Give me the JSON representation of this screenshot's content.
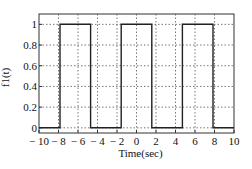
{
  "chart_data": {
    "type": "line",
    "title": "",
    "xlabel": "Time(sec)",
    "ylabel": "f1(t)",
    "xlim": [
      -10,
      10
    ],
    "ylim": [
      -0.05,
      1.1
    ],
    "grid": true,
    "legend": null,
    "x_ticks": [
      -10,
      -8,
      -6,
      -4,
      -2,
      0,
      2,
      4,
      6,
      8,
      10
    ],
    "x_tick_labels": [
      "− 10",
      "− 8",
      "− 6",
      "− 4",
      "− 2",
      "0",
      "2",
      "4",
      "6",
      "8",
      "10"
    ],
    "y_ticks": [
      0,
      0.2,
      0.4,
      0.6,
      0.8,
      1
    ],
    "y_tick_labels": [
      "0",
      "0.2",
      "0.4",
      "0.6",
      "0.8",
      "1"
    ],
    "series": [
      {
        "name": "f1(t)",
        "description": "Rectangular pulse train, amplitude 1, width π, period 2π, truncated to [-8, 8]",
        "x": [
          -10,
          -7.85,
          -7.85,
          -4.71,
          -4.71,
          -1.57,
          -1.57,
          1.57,
          1.57,
          4.71,
          4.71,
          7.85,
          7.85,
          10
        ],
        "y": [
          0,
          0,
          1,
          1,
          0,
          0,
          1,
          1,
          0,
          0,
          1,
          1,
          0,
          0
        ]
      }
    ],
    "pulses": [
      {
        "start": -7.85,
        "end": -4.71,
        "height": 1
      },
      {
        "start": -1.57,
        "end": 1.57,
        "height": 1
      },
      {
        "start": 4.71,
        "end": 7.85,
        "height": 1
      }
    ],
    "colors": {
      "line": "#222222",
      "grid": "#555555",
      "axes": "#333333"
    }
  }
}
